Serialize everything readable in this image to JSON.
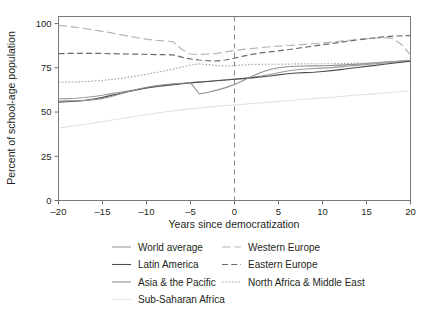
{
  "chart_data": {
    "type": "line",
    "title": "",
    "subtitle": "",
    "xlabel": "Years since democratization",
    "ylabel": "Percent of school-age population",
    "xlim": [
      -20,
      20
    ],
    "ylim": [
      0,
      104
    ],
    "xticks": [
      -20,
      -15,
      -10,
      -5,
      0,
      5,
      10,
      15,
      20
    ],
    "xticklabels": [
      "–20",
      "–15",
      "–10",
      "–5",
      "0",
      "5",
      "10",
      "15",
      "20"
    ],
    "yticks": [
      0,
      25,
      50,
      75,
      100
    ],
    "yticklabels": [
      "0",
      "25",
      "50",
      "75",
      "100"
    ],
    "grid": false,
    "legend_position": "bottom",
    "annotations": [
      {
        "type": "vline",
        "x": 0,
        "style": "dashed",
        "color": "#8a8a8a",
        "label": ""
      }
    ],
    "x": [
      -20,
      -19,
      -18,
      -17,
      -16,
      -15,
      -14,
      -13,
      -12,
      -11,
      -10,
      -9,
      -8,
      -7,
      -6,
      -5,
      -4,
      -3,
      -2,
      -1,
      0,
      1,
      2,
      3,
      4,
      5,
      6,
      7,
      8,
      9,
      10,
      11,
      12,
      13,
      14,
      15,
      16,
      17,
      18,
      19,
      20
    ],
    "series": [
      {
        "name": "World average",
        "color": "#9a9a9a",
        "dash": "solid",
        "width": 1.1,
        "values": [
          57.5,
          57.6,
          57.8,
          58.2,
          58.8,
          59.5,
          60.4,
          61.2,
          62.0,
          62.8,
          63.6,
          64.2,
          64.8,
          65.4,
          66.0,
          66.6,
          67.0,
          67.4,
          67.8,
          68.2,
          68.6,
          69.0,
          69.6,
          70.3,
          71.2,
          72.2,
          73.2,
          73.9,
          74.3,
          74.6,
          74.8,
          75.1,
          75.5,
          76.0,
          76.4,
          76.9,
          77.3,
          77.7,
          78.1,
          78.5,
          78.8
        ]
      },
      {
        "name": "Latin America",
        "color": "#4d4d4d",
        "dash": "solid",
        "width": 1.1,
        "values": [
          55.6,
          55.8,
          56.1,
          56.6,
          57.4,
          58.3,
          59.4,
          60.5,
          61.6,
          62.6,
          63.6,
          64.4,
          65.0,
          65.5,
          66.0,
          66.5,
          66.9,
          67.3,
          67.7,
          68.1,
          68.5,
          68.9,
          69.3,
          69.8,
          70.4,
          71.0,
          71.6,
          72.1,
          72.3,
          72.5,
          72.9,
          73.4,
          74.0,
          74.6,
          75.2,
          75.8,
          76.4,
          77.0,
          77.6,
          78.2,
          78.7
        ]
      },
      {
        "name": "Asia & the Pacific",
        "color": "#8f8f8f",
        "dash": "solid",
        "width": 1.1,
        "values": [
          56.2,
          56.3,
          56.4,
          56.6,
          57.0,
          57.6,
          58.8,
          60.2,
          61.6,
          62.9,
          64.0,
          64.8,
          65.4,
          65.9,
          66.3,
          66.6,
          60.2,
          61.2,
          62.4,
          63.8,
          65.6,
          67.8,
          70.2,
          72.4,
          74.0,
          75.0,
          75.6,
          75.9,
          76.0,
          76.1,
          76.2,
          76.3,
          76.5,
          76.8,
          77.1,
          77.4,
          77.8,
          78.2,
          78.6,
          79.0,
          79.3
        ]
      },
      {
        "name": "Sub-Saharan Africa",
        "color": "#e2e2e2",
        "dash": "solid",
        "width": 1.1,
        "values": [
          41.0,
          41.6,
          42.3,
          43.0,
          43.8,
          44.6,
          45.4,
          46.2,
          47.0,
          47.8,
          48.6,
          49.3,
          50.0,
          50.6,
          51.2,
          51.8,
          52.3,
          52.8,
          53.2,
          53.6,
          54.0,
          54.4,
          54.8,
          55.2,
          55.6,
          56.0,
          56.4,
          56.8,
          57.2,
          57.6,
          58.0,
          58.4,
          58.8,
          59.2,
          59.6,
          60.0,
          60.4,
          60.8,
          61.2,
          61.6,
          62.0
        ]
      },
      {
        "name": "Western Europe",
        "color": "#b5b5b5",
        "dash": "longdash",
        "width": 1.2,
        "values": [
          99.0,
          98.5,
          97.9,
          97.2,
          96.4,
          95.6,
          94.7,
          93.8,
          92.9,
          92.0,
          91.2,
          90.6,
          90.2,
          89.8,
          85.5,
          82.8,
          82.5,
          82.8,
          83.2,
          84.0,
          84.8,
          85.4,
          85.9,
          86.4,
          86.9,
          87.3,
          87.6,
          87.9,
          88.2,
          88.6,
          89.0,
          89.5,
          90.0,
          90.5,
          91.0,
          91.4,
          91.8,
          92.1,
          91.6,
          88.0,
          82.3
        ]
      },
      {
        "name": "Eastern Europe",
        "color": "#6b6b6b",
        "dash": "dash",
        "width": 1.2,
        "values": [
          83.0,
          83.1,
          83.2,
          83.2,
          83.2,
          83.1,
          83.0,
          82.9,
          82.8,
          82.7,
          82.6,
          82.5,
          82.4,
          82.3,
          81.0,
          80.0,
          79.4,
          79.0,
          78.9,
          79.4,
          80.5,
          81.6,
          82.6,
          83.4,
          84.0,
          84.6,
          85.2,
          85.9,
          86.6,
          87.3,
          88.0,
          88.7,
          89.4,
          90.1,
          90.8,
          91.4,
          92.0,
          92.5,
          92.9,
          93.1,
          93.2
        ]
      },
      {
        "name": "North Africa & Middle East",
        "color": "#a8a8a8",
        "dash": "dot",
        "width": 1.2,
        "values": [
          66.8,
          66.9,
          67.0,
          67.2,
          67.5,
          67.9,
          68.4,
          69.0,
          69.7,
          70.5,
          71.4,
          72.3,
          73.2,
          74.2,
          75.4,
          76.6,
          77.2,
          76.8,
          76.2,
          76.0,
          76.3,
          76.6,
          76.9,
          77.0,
          77.0,
          77.0,
          77.1,
          77.2,
          77.3,
          77.3,
          77.3,
          77.3,
          77.4,
          77.5,
          77.6,
          77.7,
          77.8,
          78.0,
          78.3,
          78.8,
          79.4
        ]
      }
    ]
  },
  "legend": {
    "column1": [
      {
        "label": "World average",
        "series_index": 0
      },
      {
        "label": "Latin America",
        "series_index": 1
      },
      {
        "label": "Asia & the Pacific",
        "series_index": 2
      },
      {
        "label": "Sub-Saharan Africa",
        "series_index": 3
      }
    ],
    "column2": [
      {
        "label": "Western Europe",
        "series_index": 4
      },
      {
        "label": "Eastern Europe",
        "series_index": 5
      },
      {
        "label": "North Africa & Middle East",
        "series_index": 6
      }
    ]
  }
}
